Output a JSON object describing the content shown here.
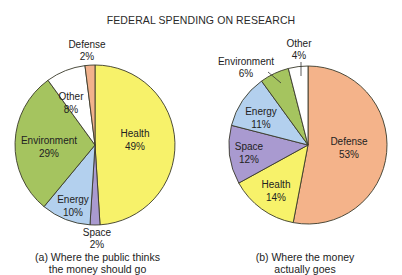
{
  "title": "FEDERAL SPENDING ON RESEARCH",
  "chart_data": [
    {
      "type": "pie",
      "title": "(a) Where the public thinks the money should go",
      "categories": [
        "Health",
        "Space",
        "Energy",
        "Environment",
        "Other",
        "Defense"
      ],
      "values": [
        49,
        2,
        10,
        29,
        8,
        2
      ],
      "colors": [
        "#f7f26a",
        "#a99ad0",
        "#b3d0ee",
        "#a5c45f",
        "#ffffff",
        "#f2b28c"
      ],
      "labels": [
        "Health 49%",
        "Space 2%",
        "Energy 10%",
        "Environment 29%",
        "Other 8%",
        "Defense 2%"
      ]
    },
    {
      "type": "pie",
      "title": "(b) Where the money actually goes",
      "categories": [
        "Defense",
        "Health",
        "Space",
        "Energy",
        "Environment",
        "Other"
      ],
      "values": [
        53,
        14,
        12,
        11,
        6,
        4
      ],
      "colors": [
        "#f4b38a",
        "#f7f26a",
        "#a99ad0",
        "#b3d0ee",
        "#a5c45f",
        "#ffffff"
      ],
      "labels": [
        "Defense 53%",
        "Health 14%",
        "Space 12%",
        "Energy 11%",
        "Environment 6%",
        "Other 4%"
      ]
    }
  ],
  "captions": {
    "a_line1": "(a) Where the public thinks",
    "a_line2": "the money should go",
    "b_line1": "(b) Where the money",
    "b_line2": "actually goes"
  },
  "pie_a_labels": {
    "health_name": "Health",
    "health_pct": "49%",
    "space_name": "Space",
    "space_pct": "2%",
    "energy_name": "Energy",
    "energy_pct": "10%",
    "environment_name": "Environment",
    "environment_pct": "29%",
    "other_name": "Other",
    "other_pct": "8%",
    "defense_name": "Defense",
    "defense_pct": "2%"
  },
  "pie_b_labels": {
    "defense_name": "Defense",
    "defense_pct": "53%",
    "health_name": "Health",
    "health_pct": "14%",
    "space_name": "Space",
    "space_pct": "12%",
    "energy_name": "Energy",
    "energy_pct": "11%",
    "environment_name": "Environment",
    "environment_pct": "6%",
    "other_name": "Other",
    "other_pct": "4%"
  }
}
